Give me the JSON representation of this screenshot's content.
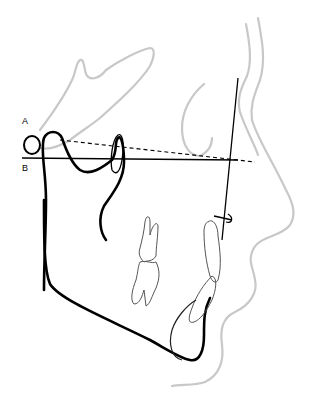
{
  "diagram": {
    "type": "cephalometric tracing (lateral profile)",
    "labels": {
      "a": "A",
      "b": "B"
    },
    "lines": {
      "dashed_reference": "line from point A to anterior",
      "solid_reference": "line from point B to anterior",
      "vertical_reference": "near-vertical facial line"
    },
    "colors": {
      "hard_tissue": "#000000",
      "soft_tissue": "#c8c8c8",
      "teeth": "#555555"
    }
  }
}
